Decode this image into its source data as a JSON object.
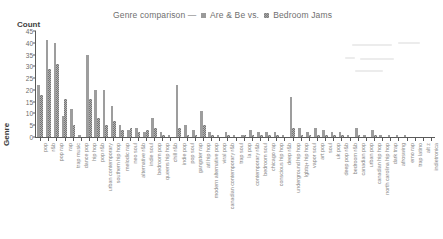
{
  "chart_data": {
    "type": "bar",
    "title_prefix": "Genre comparison —",
    "title_vs": "vs.",
    "xlabel": "Genre",
    "ylabel": "Count",
    "ylim": [
      0,
      45
    ],
    "yticks": [
      0,
      5,
      10,
      15,
      20,
      25,
      30,
      35,
      40,
      45
    ],
    "grid": false,
    "legend_position": "title-inline",
    "series": [
      {
        "name": "Are & Be",
        "color": "#9d9d9d",
        "values": [
          22,
          41,
          40,
          9,
          12,
          1,
          35,
          20,
          20,
          13,
          5,
          3,
          4,
          2,
          8,
          2,
          1,
          22,
          5,
          3,
          11,
          2,
          1,
          2,
          1,
          1,
          3,
          2,
          2,
          2,
          1,
          17,
          4,
          2,
          4,
          3,
          2,
          2,
          1,
          4,
          1,
          3,
          1,
          1,
          1,
          1,
          0,
          0,
          0
        ]
      },
      {
        "name": "Bedroom Jams",
        "color": "#b2b2b2",
        "values": [
          18,
          29,
          31,
          16,
          5,
          0,
          16,
          8,
          5,
          7,
          3,
          4,
          2,
          3,
          4,
          1,
          0,
          4,
          1,
          1,
          5,
          1,
          0,
          1,
          0,
          1,
          1,
          1,
          1,
          1,
          0,
          4,
          1,
          1,
          1,
          1,
          1,
          1,
          0,
          1,
          0,
          1,
          0,
          0,
          0,
          0,
          0,
          0,
          0
        ]
      }
    ],
    "categories": [
      "pop",
      "r&b",
      "pop rap",
      "rap",
      "trap music",
      "dance pop",
      "hip hop",
      "pop r&b",
      "urban contemporary",
      "southern hip hop",
      "melodic rap",
      "neo soul",
      "alternative r&b",
      "indie soul",
      "bedroom pop",
      "queens hip hop",
      "chill r&b",
      "indie pop",
      "pop soul",
      "gangster rap",
      "atl hip hop",
      "modern alternative pop",
      "viral pop",
      "canadian contemporary r&b",
      "trap soul",
      "la pop",
      "contemporary r&b",
      "bedroom soul",
      "chicago rap",
      "conscious hip hop",
      "deep r&b",
      "underground hip hop",
      "lgbtq+ hip hop",
      "vapor soul",
      "art pop",
      "soul",
      "uk pop",
      "deep pop r&b",
      "bedroom r&b",
      "canadian pop",
      "urban pop",
      "canadian hip hop",
      "north carolina hip hop",
      "dark trap",
      "afroswing",
      "emo rap",
      "trap latino",
      "alt z",
      "indietronica"
    ]
  }
}
